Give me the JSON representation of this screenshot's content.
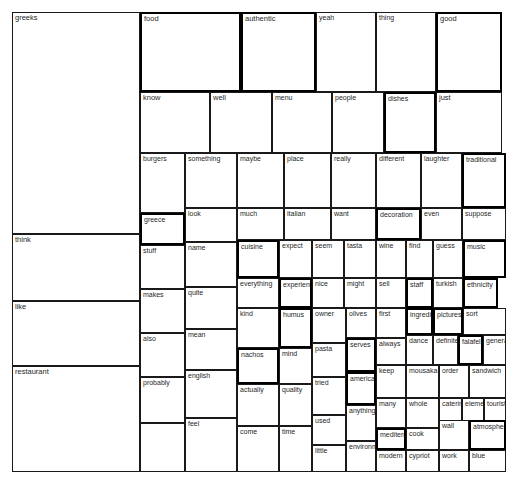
{
  "chart_data": {
    "type": "treemap",
    "title": "",
    "subtitle": "",
    "xlabel": "",
    "ylabel": "",
    "legend": [],
    "grid": false,
    "canvas": {
      "width": 516,
      "height": 487,
      "plot_left": 12,
      "plot_top": 12,
      "plot_right": 510,
      "plot_bottom": 472
    },
    "style": {
      "fill": "#ffffff",
      "stroke": "#1a1a1a",
      "text": "#1f1f1f"
    },
    "nodes": [
      {
        "label": "greeks",
        "x": 12,
        "y": 12,
        "w": 128,
        "h": 222,
        "thick": false
      },
      {
        "label": "think",
        "x": 12,
        "y": 234,
        "w": 128,
        "h": 67,
        "thick": false
      },
      {
        "label": "like",
        "x": 12,
        "y": 301,
        "w": 128,
        "h": 65,
        "thick": false
      },
      {
        "label": "restaurant",
        "x": 12,
        "y": 366,
        "w": 128,
        "h": 106,
        "thick": false
      },
      {
        "label": "food",
        "x": 140,
        "y": 12,
        "w": 101,
        "h": 80,
        "thick": true
      },
      {
        "label": "know",
        "x": 140,
        "y": 92,
        "w": 70,
        "h": 61,
        "thick": false
      },
      {
        "label": "well",
        "x": 210,
        "y": 92,
        "w": 62,
        "h": 61,
        "thick": false
      },
      {
        "label": "burgers",
        "x": 140,
        "y": 153,
        "w": 45,
        "h": 60,
        "thick": false
      },
      {
        "label": "greece",
        "x": 140,
        "y": 213,
        "w": 45,
        "h": 32,
        "thick": true
      },
      {
        "label": "stuff",
        "x": 140,
        "y": 245,
        "w": 45,
        "h": 44,
        "thick": false
      },
      {
        "label": "makes",
        "x": 140,
        "y": 289,
        "w": 45,
        "h": 44,
        "thick": false
      },
      {
        "label": "also",
        "x": 140,
        "y": 333,
        "w": 45,
        "h": 44,
        "thick": false
      },
      {
        "label": "probably",
        "x": 140,
        "y": 377,
        "w": 45,
        "h": 46,
        "thick": false
      },
      {
        "label": "probably2",
        "x": 140,
        "y": 423,
        "w": 45,
        "h": 49,
        "thick": false,
        "hide_label": true
      },
      {
        "label": "something",
        "x": 185,
        "y": 153,
        "w": 52,
        "h": 55,
        "thick": false
      },
      {
        "label": "look",
        "x": 185,
        "y": 208,
        "w": 52,
        "h": 34,
        "thick": false
      },
      {
        "label": "name",
        "x": 185,
        "y": 242,
        "w": 52,
        "h": 45,
        "thick": false
      },
      {
        "label": "quite",
        "x": 185,
        "y": 287,
        "w": 52,
        "h": 42,
        "thick": false
      },
      {
        "label": "mean",
        "x": 185,
        "y": 329,
        "w": 52,
        "h": 41,
        "thick": false
      },
      {
        "label": "english",
        "x": 185,
        "y": 370,
        "w": 52,
        "h": 48,
        "thick": false
      },
      {
        "label": "feel",
        "x": 185,
        "y": 418,
        "w": 52,
        "h": 54,
        "thick": false
      },
      {
        "label": "authentic",
        "x": 241,
        "y": 12,
        "w": 75,
        "h": 80,
        "thick": true
      },
      {
        "label": "menu",
        "x": 272,
        "y": 92,
        "w": 60,
        "h": 61,
        "thick": false
      },
      {
        "label": "maybe",
        "x": 237,
        "y": 153,
        "w": 47,
        "h": 55,
        "thick": false
      },
      {
        "label": "place",
        "x": 284,
        "y": 153,
        "w": 47,
        "h": 55,
        "thick": false
      },
      {
        "label": "much",
        "x": 237,
        "y": 208,
        "w": 47,
        "h": 32,
        "thick": false
      },
      {
        "label": "italian",
        "x": 284,
        "y": 208,
        "w": 47,
        "h": 32,
        "thick": false
      },
      {
        "label": "cuisine",
        "x": 237,
        "y": 240,
        "w": 42,
        "h": 38,
        "thick": true
      },
      {
        "label": "everything",
        "x": 237,
        "y": 278,
        "w": 42,
        "h": 30,
        "thick": false
      },
      {
        "label": "kind",
        "x": 237,
        "y": 308,
        "w": 42,
        "h": 40,
        "thick": false
      },
      {
        "label": "nachos",
        "x": 237,
        "y": 348,
        "w": 42,
        "h": 36,
        "thick": true
      },
      {
        "label": "actually",
        "x": 237,
        "y": 384,
        "w": 42,
        "h": 42,
        "thick": false
      },
      {
        "label": "come",
        "x": 237,
        "y": 426,
        "w": 42,
        "h": 46,
        "thick": false
      },
      {
        "label": "expect",
        "x": 279,
        "y": 240,
        "w": 33,
        "h": 38,
        "thick": false
      },
      {
        "label": "experience",
        "x": 279,
        "y": 278,
        "w": 33,
        "h": 30,
        "thick": true
      },
      {
        "label": "humus",
        "x": 279,
        "y": 308,
        "w": 33,
        "h": 40,
        "thick": true
      },
      {
        "label": "mind",
        "x": 279,
        "y": 348,
        "w": 33,
        "h": 36,
        "thick": false
      },
      {
        "label": "quality",
        "x": 279,
        "y": 384,
        "w": 33,
        "h": 42,
        "thick": false
      },
      {
        "label": "time",
        "x": 279,
        "y": 426,
        "w": 33,
        "h": 46,
        "thick": false
      },
      {
        "label": "yeah",
        "x": 316,
        "y": 12,
        "w": 60,
        "h": 80,
        "thick": false
      },
      {
        "label": "people",
        "x": 332,
        "y": 92,
        "w": 52,
        "h": 61,
        "thick": false
      },
      {
        "label": "really",
        "x": 331,
        "y": 153,
        "w": 45,
        "h": 55,
        "thick": false
      },
      {
        "label": "want",
        "x": 331,
        "y": 208,
        "w": 45,
        "h": 32,
        "thick": false
      },
      {
        "label": "seem",
        "x": 312,
        "y": 240,
        "w": 32,
        "h": 38,
        "thick": false
      },
      {
        "label": "nice",
        "x": 312,
        "y": 278,
        "w": 32,
        "h": 30,
        "thick": false
      },
      {
        "label": "owner",
        "x": 312,
        "y": 308,
        "w": 34,
        "h": 35,
        "thick": false
      },
      {
        "label": "pasta",
        "x": 312,
        "y": 343,
        "w": 34,
        "h": 34,
        "thick": false
      },
      {
        "label": "tried",
        "x": 312,
        "y": 377,
        "w": 34,
        "h": 38,
        "thick": false
      },
      {
        "label": "used",
        "x": 312,
        "y": 415,
        "w": 34,
        "h": 30,
        "thick": false
      },
      {
        "label": "little",
        "x": 312,
        "y": 445,
        "w": 34,
        "h": 27,
        "thick": false
      },
      {
        "label": "tasta",
        "x": 344,
        "y": 240,
        "w": 32,
        "h": 38,
        "thick": false
      },
      {
        "label": "might",
        "x": 344,
        "y": 278,
        "w": 32,
        "h": 30,
        "thick": false
      },
      {
        "label": "olives",
        "x": 346,
        "y": 308,
        "w": 30,
        "h": 30,
        "thick": false
      },
      {
        "label": "serves",
        "x": 346,
        "y": 338,
        "w": 30,
        "h": 34,
        "thick": true
      },
      {
        "label": "america",
        "x": 346,
        "y": 372,
        "w": 30,
        "h": 33,
        "thick": true
      },
      {
        "label": "anything",
        "x": 346,
        "y": 405,
        "w": 30,
        "h": 36,
        "thick": false
      },
      {
        "label": "environment",
        "x": 346,
        "y": 441,
        "w": 30,
        "h": 31,
        "thick": false
      },
      {
        "label": "thing",
        "x": 376,
        "y": 12,
        "w": 60,
        "h": 80,
        "thick": false
      },
      {
        "label": "dishes",
        "x": 384,
        "y": 92,
        "w": 52,
        "h": 61,
        "thick": true
      },
      {
        "label": "different",
        "x": 376,
        "y": 153,
        "w": 45,
        "h": 55,
        "thick": false
      },
      {
        "label": "decoration",
        "x": 376,
        "y": 208,
        "w": 45,
        "h": 32,
        "thick": true
      },
      {
        "label": "wine",
        "x": 376,
        "y": 240,
        "w": 30,
        "h": 38,
        "thick": false
      },
      {
        "label": "sell",
        "x": 376,
        "y": 278,
        "w": 30,
        "h": 30,
        "thick": false
      },
      {
        "label": "first",
        "x": 376,
        "y": 308,
        "w": 30,
        "h": 30,
        "thick": false
      },
      {
        "label": "always",
        "x": 376,
        "y": 338,
        "w": 30,
        "h": 27,
        "thick": false
      },
      {
        "label": "keep",
        "x": 376,
        "y": 365,
        "w": 30,
        "h": 33,
        "thick": false
      },
      {
        "label": "many",
        "x": 376,
        "y": 398,
        "w": 30,
        "h": 30,
        "thick": false
      },
      {
        "label": "mediterranean",
        "x": 376,
        "y": 428,
        "w": 30,
        "h": 22,
        "thick": true
      },
      {
        "label": "modern",
        "x": 376,
        "y": 450,
        "w": 30,
        "h": 22,
        "thick": false
      },
      {
        "label": "good",
        "x": 436,
        "y": 12,
        "w": 66,
        "h": 80,
        "thick": true
      },
      {
        "label": "just",
        "x": 436,
        "y": 92,
        "w": 66,
        "h": 61,
        "thick": false
      },
      {
        "label": "laughter",
        "x": 421,
        "y": 153,
        "w": 41,
        "h": 55,
        "thick": false
      },
      {
        "label": "traditional",
        "x": 462,
        "y": 153,
        "w": 44,
        "h": 55,
        "thick": true
      },
      {
        "label": "even",
        "x": 421,
        "y": 208,
        "w": 41,
        "h": 32,
        "thick": false
      },
      {
        "label": "suppose",
        "x": 462,
        "y": 208,
        "w": 44,
        "h": 32,
        "thick": false
      },
      {
        "label": "find",
        "x": 406,
        "y": 240,
        "w": 27,
        "h": 38,
        "thick": false
      },
      {
        "label": "guess",
        "x": 433,
        "y": 240,
        "w": 30,
        "h": 38,
        "thick": false
      },
      {
        "label": "music",
        "x": 463,
        "y": 240,
        "w": 43,
        "h": 38,
        "thick": true
      },
      {
        "label": "staff",
        "x": 406,
        "y": 278,
        "w": 27,
        "h": 30,
        "thick": true
      },
      {
        "label": "turkish",
        "x": 433,
        "y": 278,
        "w": 30,
        "h": 30,
        "thick": false
      },
      {
        "label": "ethnicity",
        "x": 463,
        "y": 278,
        "w": 35,
        "h": 30,
        "thick": true
      },
      {
        "label": "ingredient",
        "x": 406,
        "y": 308,
        "w": 27,
        "h": 27,
        "thick": true
      },
      {
        "label": "pictures",
        "x": 433,
        "y": 308,
        "w": 30,
        "h": 27,
        "thick": true
      },
      {
        "label": "sort",
        "x": 463,
        "y": 308,
        "w": 43,
        "h": 27,
        "thick": false
      },
      {
        "label": "dance",
        "x": 406,
        "y": 335,
        "w": 27,
        "h": 30,
        "thick": false
      },
      {
        "label": "definitely",
        "x": 433,
        "y": 335,
        "w": 25,
        "h": 30,
        "thick": false
      },
      {
        "label": "falafel",
        "x": 458,
        "y": 335,
        "w": 25,
        "h": 30,
        "thick": true
      },
      {
        "label": "general",
        "x": 483,
        "y": 335,
        "w": 23,
        "h": 30,
        "thick": false
      },
      {
        "label": "mousaka",
        "x": 406,
        "y": 365,
        "w": 33,
        "h": 33,
        "thick": false
      },
      {
        "label": "order",
        "x": 439,
        "y": 365,
        "w": 30,
        "h": 33,
        "thick": false
      },
      {
        "label": "sandwich",
        "x": 469,
        "y": 365,
        "w": 37,
        "h": 33,
        "thick": false
      },
      {
        "label": "whole",
        "x": 406,
        "y": 398,
        "w": 33,
        "h": 30,
        "thick": false
      },
      {
        "label": "catering",
        "x": 439,
        "y": 398,
        "w": 23,
        "h": 30,
        "thick": false
      },
      {
        "label": "element",
        "x": 462,
        "y": 398,
        "w": 22,
        "h": 30,
        "thick": false
      },
      {
        "label": "tourist",
        "x": 484,
        "y": 398,
        "w": 22,
        "h": 30,
        "thick": false
      },
      {
        "label": "cook",
        "x": 406,
        "y": 428,
        "w": 33,
        "h": 22,
        "thick": false
      },
      {
        "label": "cypriot",
        "x": 406,
        "y": 450,
        "w": 33,
        "h": 22,
        "thick": false
      },
      {
        "label": "wall",
        "x": 439,
        "y": 420,
        "w": 30,
        "h": 30,
        "thick": false
      },
      {
        "label": "atmosphere",
        "x": 469,
        "y": 420,
        "w": 37,
        "h": 30,
        "thick": true
      },
      {
        "label": "work",
        "x": 439,
        "y": 450,
        "w": 30,
        "h": 22,
        "thick": false
      },
      {
        "label": "blue",
        "x": 469,
        "y": 450,
        "w": 37,
        "h": 22,
        "thick": false
      }
    ]
  }
}
